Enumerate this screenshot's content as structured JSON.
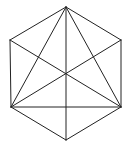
{
  "diagram": {
    "title": "",
    "shape": "regular hexagon with diagonals",
    "stroke_color": "#222222",
    "background": "#ffffff",
    "stroke_width": 1,
    "vertices": {
      "top": [
        66,
        7
      ],
      "upper_right": [
        121,
        40
      ],
      "lower_right": [
        121,
        107
      ],
      "bottom": [
        66,
        140
      ],
      "lower_left": [
        11,
        107
      ],
      "upper_left": [
        10,
        40
      ]
    },
    "edges": [
      {
        "name": "hexagon-edge-top-upper-right",
        "from": "top",
        "to": "upper_right"
      },
      {
        "name": "hexagon-edge-upper-right-lower-right",
        "from": "upper_right",
        "to": "lower_right"
      },
      {
        "name": "hexagon-edge-lower-right-bottom",
        "from": "lower_right",
        "to": "bottom"
      },
      {
        "name": "hexagon-edge-bottom-lower-left",
        "from": "bottom",
        "to": "lower_left"
      },
      {
        "name": "hexagon-edge-lower-left-upper-left",
        "from": "lower_left",
        "to": "upper_left"
      },
      {
        "name": "hexagon-edge-upper-left-top",
        "from": "upper_left",
        "to": "top"
      },
      {
        "name": "diagonal-top-bottom",
        "from": "top",
        "to": "bottom"
      },
      {
        "name": "diagonal-top-lower-left",
        "from": "top",
        "to": "lower_left"
      },
      {
        "name": "diagonal-top-lower-right",
        "from": "top",
        "to": "lower_right"
      },
      {
        "name": "diagonal-upper-left-lower-right",
        "from": "upper_left",
        "to": "lower_right"
      },
      {
        "name": "diagonal-upper-right-lower-left",
        "from": "upper_right",
        "to": "lower_left"
      },
      {
        "name": "chord-lower-left-lower-right",
        "from": "lower_left",
        "to": "lower_right"
      }
    ]
  }
}
